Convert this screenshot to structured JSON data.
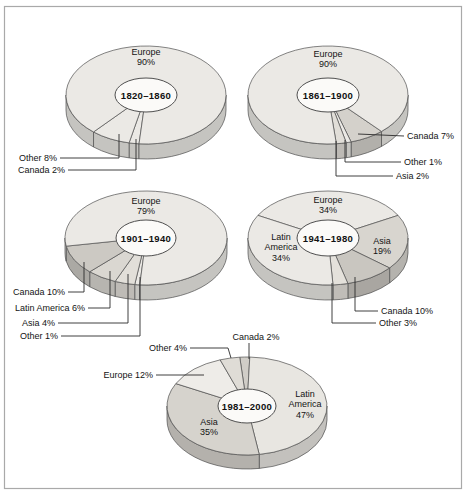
{
  "figure": {
    "background": "#ffffff",
    "frame_border_color": "#a9a9a9",
    "stroke_color": "#4f4f4f",
    "leader_color": "#2b2b2b",
    "text_color": "#141414",
    "hole_fill": "#fbfaf8"
  },
  "chart_data": [
    {
      "type": "pie",
      "period": "1820–1860",
      "unit": "%",
      "slices": [
        {
          "name": "Canada",
          "pct": 2,
          "fill": "#ebe9e5"
        },
        {
          "name": "Other",
          "pct": 8,
          "fill": "#ebe9e5"
        },
        {
          "name": "Europe",
          "pct": 90,
          "fill": "#ebe9e5"
        }
      ],
      "layout": {
        "cx": 146,
        "cy": 95,
        "rx": 80,
        "ry": 49,
        "depth": 15,
        "hole_rx": 31,
        "hole_ry": 17,
        "start_deg": 95
      },
      "inside_labels": [
        {
          "lines": [
            "Europe",
            "90%"
          ],
          "dx": 0,
          "dy": -38
        }
      ],
      "outside_labels": [
        {
          "lines": [
            "Other 8%"
          ],
          "x": 57,
          "y": 158,
          "anchor": "end",
          "leader": [
            [
              60,
              158
            ],
            [
              119,
              158
            ],
            [
              119,
              134
            ]
          ]
        },
        {
          "lines": [
            "Canada 2%"
          ],
          "x": 65,
          "y": 170,
          "anchor": "end",
          "leader": [
            [
              68,
              170
            ],
            [
              136,
              170
            ],
            [
              136,
              139
            ]
          ]
        }
      ]
    },
    {
      "type": "pie",
      "period": "1861–1900",
      "unit": "%",
      "slices": [
        {
          "name": "Canada",
          "pct": 7,
          "fill": "#d4d1cb"
        },
        {
          "name": "Other",
          "pct": 1,
          "fill": "#ebe9e5"
        },
        {
          "name": "Asia",
          "pct": 2,
          "fill": "#e1ded8"
        },
        {
          "name": "Europe",
          "pct": 90,
          "fill": "#ebe9e5"
        }
      ],
      "layout": {
        "cx": 328,
        "cy": 95,
        "rx": 80,
        "ry": 49,
        "depth": 15,
        "hole_rx": 31,
        "hole_ry": 17,
        "start_deg": 48
      },
      "inside_labels": [
        {
          "lines": [
            "Europe",
            "90%"
          ],
          "dx": 0,
          "dy": -36
        }
      ],
      "outside_labels": [
        {
          "lines": [
            "Canada 7%"
          ],
          "x": 407,
          "y": 136,
          "anchor": "start",
          "leader": [
            [
              404,
              136
            ],
            [
              358,
              134
            ]
          ]
        },
        {
          "lines": [
            "Other 1%"
          ],
          "x": 404,
          "y": 162,
          "anchor": "start",
          "leader": [
            [
              401,
              162
            ],
            [
              345,
              162
            ],
            [
              345,
              140
            ]
          ]
        },
        {
          "lines": [
            "Asia 2%"
          ],
          "x": 396,
          "y": 176,
          "anchor": "start",
          "leader": [
            [
              393,
              176
            ],
            [
              336,
              176
            ],
            [
              336,
              141
            ]
          ]
        }
      ]
    },
    {
      "type": "pie",
      "period": "1901–1940",
      "unit": "%",
      "slices": [
        {
          "name": "Other",
          "pct": 1,
          "fill": "#ebe9e5"
        },
        {
          "name": "Asia",
          "pct": 4,
          "fill": "#e2dfd9"
        },
        {
          "name": "Latin America",
          "pct": 6,
          "fill": "#dad7d1"
        },
        {
          "name": "Canada",
          "pct": 10,
          "fill": "#ccc9c3"
        },
        {
          "name": "Europe",
          "pct": 79,
          "fill": "#ebe9e5"
        }
      ],
      "layout": {
        "cx": 146,
        "cy": 238,
        "rx": 81,
        "ry": 47,
        "depth": 15,
        "hole_rx": 30,
        "hole_ry": 18,
        "start_deg": 94.4
      },
      "inside_labels": [
        {
          "lines": [
            "Europe",
            "79%"
          ],
          "dx": 0,
          "dy": -32
        }
      ],
      "outside_labels": [
        {
          "lines": [
            "Canada 10%"
          ],
          "x": 65,
          "y": 292,
          "anchor": "end",
          "leader": [
            [
              68,
              292
            ],
            [
              84,
              292
            ],
            [
              84,
              262
            ]
          ]
        },
        {
          "lines": [
            "Latin America 6%"
          ],
          "x": 85,
          "y": 308,
          "anchor": "end",
          "leader": [
            [
              88,
              308
            ],
            [
              110,
              308
            ],
            [
              110,
              271
            ]
          ]
        },
        {
          "lines": [
            "Asia 4%"
          ],
          "x": 55,
          "y": 323,
          "anchor": "end",
          "leader": [
            [
              58,
              323
            ],
            [
              128,
              323
            ],
            [
              128,
              274
            ]
          ]
        },
        {
          "lines": [
            "Other 1%"
          ],
          "x": 58,
          "y": 336,
          "anchor": "end",
          "leader": [
            [
              61,
              336
            ],
            [
              140,
              336
            ],
            [
              140,
              277
            ]
          ]
        }
      ]
    },
    {
      "type": "pie",
      "period": "1941–1980",
      "unit": "%",
      "slices": [
        {
          "name": "Europe",
          "pct": 34,
          "fill": "#ebe9e5"
        },
        {
          "name": "Asia",
          "pct": 19,
          "fill": "#d8d5cf"
        },
        {
          "name": "Canada",
          "pct": 10,
          "fill": "#c9c6c0"
        },
        {
          "name": "Other",
          "pct": 3,
          "fill": "#e4e1db"
        },
        {
          "name": "Latin America",
          "pct": 34,
          "fill": "#ebe9e5"
        }
      ],
      "layout": {
        "cx": 328,
        "cy": 238,
        "rx": 80,
        "ry": 47,
        "depth": 15,
        "hole_rx": 31,
        "hole_ry": 18,
        "start_deg": 208.8
      },
      "inside_labels": [
        {
          "lines": [
            "Europe",
            "34%"
          ],
          "dx": 0,
          "dy": -33
        },
        {
          "lines": [
            "Asia",
            "19%"
          ],
          "dx": 54,
          "dy": 8
        },
        {
          "lines": [
            "Latin",
            "America",
            "34%"
          ],
          "dx": -47,
          "dy": 9
        }
      ],
      "outside_labels": [
        {
          "lines": [
            "Canada 10%"
          ],
          "x": 381,
          "y": 311,
          "anchor": "start",
          "leader": [
            [
              378,
              311
            ],
            [
              355,
              311
            ],
            [
              355,
              277
            ]
          ]
        },
        {
          "lines": [
            "Other 3%"
          ],
          "x": 379,
          "y": 323,
          "anchor": "start",
          "leader": [
            [
              376,
              323
            ],
            [
              332,
              323
            ],
            [
              332,
              283
            ]
          ]
        }
      ]
    },
    {
      "type": "pie",
      "period": "1981–2000",
      "unit": "%",
      "slices": [
        {
          "name": "Canada",
          "pct": 2,
          "fill": "#d0cdc7"
        },
        {
          "name": "Latin America",
          "pct": 47,
          "fill": "#e8e6e1"
        },
        {
          "name": "Asia",
          "pct": 35,
          "fill": "#d6d3cd"
        },
        {
          "name": "Europe",
          "pct": 12,
          "fill": "#eeece8"
        },
        {
          "name": "Other",
          "pct": 4,
          "fill": "#dfdcd6"
        }
      ],
      "layout": {
        "cx": 247,
        "cy": 406,
        "rx": 80,
        "ry": 49,
        "depth": 14,
        "hole_rx": 29,
        "hole_ry": 17,
        "start_deg": 264.8
      },
      "inside_labels": [
        {
          "lines": [
            "Latin",
            "America",
            "47%"
          ],
          "dx": 58,
          "dy": -2
        },
        {
          "lines": [
            "Asia",
            "35%"
          ],
          "dx": -38,
          "dy": 21
        }
      ],
      "outside_labels": [
        {
          "lines": [
            "Canada 2%"
          ],
          "x": 256,
          "y": 337,
          "anchor": "middle",
          "leader": [
            [
              249,
              343
            ],
            [
              249,
              359
            ]
          ]
        },
        {
          "lines": [
            "Other 4%"
          ],
          "x": 187,
          "y": 348,
          "anchor": "end",
          "leader": [
            [
              190,
              348
            ],
            [
              228,
              348
            ],
            [
              231,
              358
            ]
          ]
        },
        {
          "lines": [
            "Europe 12%"
          ],
          "x": 153,
          "y": 375,
          "anchor": "end",
          "leader": [
            [
              156,
              375
            ],
            [
              204,
              375
            ]
          ]
        }
      ]
    }
  ]
}
